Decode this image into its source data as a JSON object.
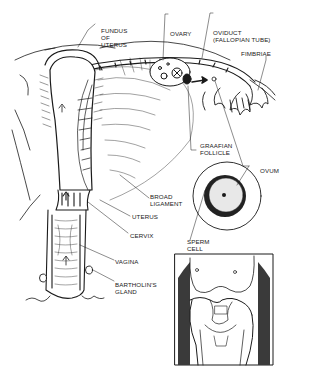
{
  "figure": {
    "labels": {
      "fundus": [
        "FUNDUS",
        "OF",
        "UTERUS"
      ],
      "ovary": [
        "OVARY"
      ],
      "oviduct": [
        "OVIDUCT",
        "(FALLOPIAN TUBE)"
      ],
      "fimbriae": [
        "FIMBRIAE"
      ],
      "graafian": [
        "GRAAFIAN",
        "FOLLICLE"
      ],
      "ovum": [
        "OVUM"
      ],
      "broad_ligament": [
        "BROAD",
        "LIGAMENT"
      ],
      "uterus": [
        "UTERUS"
      ],
      "cervix": [
        "CERVIX"
      ],
      "vagina": [
        "VAGINA"
      ],
      "sperm_cell": [
        "SPERM",
        "CELL"
      ],
      "bartholins": [
        "BARTHOLIN'S",
        "GLAND"
      ]
    },
    "colors": {
      "ink": "#1a1a1a",
      "shade": "#3a3a3a",
      "paper": "#ffffff"
    }
  }
}
